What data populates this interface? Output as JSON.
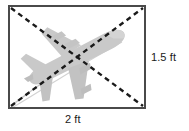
{
  "figure": {
    "type": "geometry-diagram",
    "shape": "rectangle",
    "labels": {
      "width": "2 ft",
      "height": "1.5 ft"
    },
    "colors": {
      "rectangle_border": "#4a4a4a",
      "diagonal_dash": "#1a1a1a",
      "airplane_fill": "#c9c9c9",
      "airplane_shade": "#bdbdbd",
      "airplane_outline": "#bcbcbc",
      "background": "#ffffff",
      "label_text": "#1a1a1a"
    },
    "rectangle": {
      "x": 9,
      "y": 6,
      "width": 136,
      "height": 102,
      "stroke_width": 2
    },
    "diagonals": [
      {
        "name": "diagonal-top-left-to-bottom-right",
        "x1": 11,
        "y1": 8,
        "x2": 143,
        "y2": 106
      },
      {
        "name": "diagonal-bottom-left-to-top-right",
        "x1": 11,
        "y1": 106,
        "x2": 143,
        "y2": 8
      }
    ],
    "airplane": {
      "orientation": "nose-upper-right",
      "rotation_deg": -27,
      "contrail": true
    }
  }
}
